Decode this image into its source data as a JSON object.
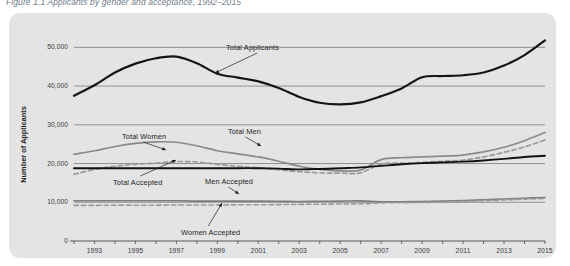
{
  "figure": {
    "caption": "Figure 1.1  Applicants by gender and acceptance, 1992–2015"
  },
  "chart_data": {
    "type": "line",
    "title": "",
    "xlabel": "",
    "ylabel": "Number of Applicants",
    "xlim": [
      1992,
      2015
    ],
    "ylim": [
      0,
      55000
    ],
    "grid": true,
    "legend_position": "inline-annotations",
    "ytick_labels": [
      "50,000",
      "40,000",
      "30,000",
      "20,000",
      "10,000",
      "0"
    ],
    "ytick_values": [
      50000,
      40000,
      30000,
      20000,
      10000,
      0
    ],
    "xtick_labels": [
      "1993",
      "1995",
      "1997",
      "1999",
      "2001",
      "2003",
      "2005",
      "2007",
      "2009",
      "2011",
      "2013",
      "2015"
    ],
    "xtick_values": [
      1993,
      1995,
      1997,
      1999,
      2001,
      2003,
      2005,
      2007,
      2009,
      2011,
      2013,
      2015
    ],
    "x": [
      1992,
      1993,
      1994,
      1995,
      1996,
      1997,
      1998,
      1999,
      2000,
      2001,
      2002,
      2003,
      2004,
      2005,
      2006,
      2007,
      2008,
      2009,
      2010,
      2011,
      2012,
      2013,
      2014,
      2015
    ],
    "series": [
      {
        "name": "Total Applicants",
        "color": "#151515",
        "style": "solid",
        "width": 2.2,
        "values": [
          37500,
          40200,
          43500,
          45800,
          47200,
          47600,
          45900,
          43200,
          42200,
          41200,
          39500,
          37200,
          35700,
          35300,
          35800,
          37400,
          39400,
          42300,
          42600,
          42800,
          43500,
          45300,
          48000,
          51800
        ]
      },
      {
        "name": "Total Men",
        "color": "#8a8a8a",
        "style": "solid",
        "width": 1.7,
        "values": [
          22400,
          23300,
          24400,
          25200,
          25600,
          25500,
          24600,
          23300,
          22500,
          21700,
          20600,
          19300,
          18500,
          18100,
          18300,
          21000,
          21500,
          21700,
          21900,
          22200,
          23000,
          24200,
          25900,
          28000
        ]
      },
      {
        "name": "Total Women",
        "color": "#9a9a9a",
        "style": "dashed",
        "width": 1.7,
        "values": [
          17200,
          18500,
          19300,
          19800,
          20100,
          20500,
          20400,
          19800,
          19300,
          18900,
          18400,
          17900,
          17600,
          17500,
          17600,
          19900,
          20100,
          20300,
          20600,
          20900,
          21700,
          22900,
          24300,
          26100
        ]
      },
      {
        "name": "Total Accepted",
        "color": "#111111",
        "style": "solid",
        "width": 1.9,
        "values": [
          18800,
          18800,
          18800,
          18800,
          18800,
          18800,
          18800,
          18800,
          18800,
          18800,
          18700,
          18500,
          18600,
          18800,
          19000,
          19400,
          19800,
          20100,
          20300,
          20500,
          20800,
          21200,
          21700,
          22000
        ]
      },
      {
        "name": "Men Accepted",
        "color": "#7e7e7e",
        "style": "solid",
        "width": 1.6,
        "values": [
          10400,
          10400,
          10400,
          10400,
          10400,
          10400,
          10300,
          10300,
          10300,
          10300,
          10250,
          10200,
          10250,
          10300,
          10350,
          10100,
          10150,
          10200,
          10300,
          10450,
          10650,
          10850,
          11050,
          11250
        ]
      },
      {
        "name": "Women Accepted",
        "color": "#9a9a9a",
        "style": "dashed",
        "width": 1.6,
        "values": [
          9200,
          9200,
          9250,
          9250,
          9250,
          9300,
          9300,
          9300,
          9350,
          9350,
          9400,
          9450,
          9500,
          9550,
          9600,
          9850,
          9900,
          9950,
          10050,
          10200,
          10400,
          10600,
          10800,
          11000
        ]
      }
    ],
    "annotations": [
      {
        "label": "Total Applicants",
        "x": 226,
        "y": 43
      },
      {
        "label": "Total Women",
        "x": 122,
        "y": 132
      },
      {
        "label": "Total Men",
        "x": 228,
        "y": 127
      },
      {
        "label": "Total Accepted",
        "x": 113,
        "y": 178
      },
      {
        "label": "Men Accepted",
        "x": 205,
        "y": 177
      },
      {
        "label": "Women Accepted",
        "x": 181,
        "y": 228
      }
    ]
  }
}
